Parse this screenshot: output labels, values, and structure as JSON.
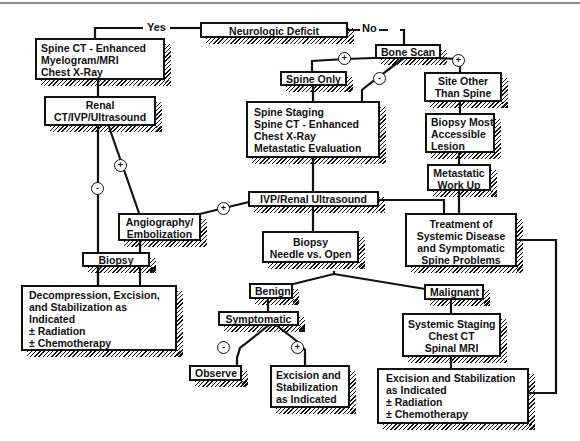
{
  "diagram": {
    "type": "flowchart",
    "nodes": {
      "neurologic_deficit": "Neurologic Deficit",
      "yes_label": "Yes",
      "no_label": "No",
      "spine_ct_block": [
        "Spine CT - Enhanced",
        "Myelogram/MRI",
        "Chest X-Ray"
      ],
      "renal_ct": [
        "Renal",
        "CT/IVP/Ultrasound"
      ],
      "angiography": [
        "Angiography/",
        "Embolization"
      ],
      "biopsy_left": "Biopsy",
      "decompression": [
        "Decompression, Excision,",
        "and Stabilization as",
        "Indicated",
        "± Radiation",
        "± Chemotherapy"
      ],
      "bone_scan": "Bone Scan",
      "spine_only": "Spine Only",
      "spine_staging": [
        "Spine Staging",
        "Spine CT - Enhanced",
        "Chest X-Ray",
        "Metastatic Evaluation"
      ],
      "site_other": [
        "Site Other",
        "Than Spine"
      ],
      "biopsy_most": [
        "Biopsy Most",
        "Accessible",
        "Lesion"
      ],
      "metastatic_workup": [
        "Metastatic",
        "Work Up"
      ],
      "ivp_renal": "IVP/Renal Ultrasound",
      "treatment_systemic": [
        "Treatment of",
        "Systemic Disease",
        "and Symptomatic",
        "Spine Problems"
      ],
      "biopsy_needle": [
        "Biopsy",
        "Needle vs. Open"
      ],
      "benign": "Benign",
      "malignant": "Malignant",
      "symptomatic": "Symptomatic",
      "observe": "Observe",
      "excision_benign": [
        "Excision and",
        "Stabilization",
        "as Indicated"
      ],
      "systemic_staging": [
        "Systemic Staging",
        "Chest CT",
        "Spinal MRI"
      ],
      "excision_malignant": [
        "Excision and Stabilization",
        "as Indicated",
        "± Radiation",
        "± Chemotherapy"
      ]
    },
    "signs": {
      "plus": "+",
      "minus": "-"
    },
    "edges": [
      {
        "from": "Neurologic Deficit",
        "to": "Spine CT - Enhanced",
        "label": "Yes"
      },
      {
        "from": "Neurologic Deficit",
        "to": "Bone Scan",
        "label": "No"
      },
      {
        "from": "Spine CT - Enhanced",
        "to": "Renal CT/IVP/Ultrasound"
      },
      {
        "from": "Renal CT/IVP/Ultrasound",
        "to": "Biopsy",
        "label": "-"
      },
      {
        "from": "Renal CT/IVP/Ultrasound",
        "to": "Angiography/Embolization",
        "label": "+"
      },
      {
        "from": "Angiography/Embolization",
        "to": "Biopsy"
      },
      {
        "from": "Biopsy",
        "to": "Decompression, Excision, and Stabilization"
      },
      {
        "from": "Bone Scan",
        "to": "Spine Only",
        "label": "+"
      },
      {
        "from": "Bone Scan",
        "to": "Spine Staging",
        "label": "-"
      },
      {
        "from": "Bone Scan",
        "to": "Site Other Than Spine",
        "label": "+"
      },
      {
        "from": "Spine Only",
        "to": "Spine Staging"
      },
      {
        "from": "Site Other Than Spine",
        "to": "Biopsy Most Accessible Lesion"
      },
      {
        "from": "Biopsy Most Accessible Lesion",
        "to": "Metastatic Work Up"
      },
      {
        "from": "Metastatic Work Up",
        "to": "Treatment of Systemic Disease"
      },
      {
        "from": "Spine Staging",
        "to": "IVP/Renal Ultrasound"
      },
      {
        "from": "IVP/Renal Ultrasound",
        "to": "Angiography/Embolization",
        "label": "+"
      },
      {
        "from": "IVP/Renal Ultrasound",
        "to": "Treatment of Systemic Disease"
      },
      {
        "from": "IVP/Renal Ultrasound",
        "to": "Biopsy Needle vs. Open"
      },
      {
        "from": "Biopsy Needle vs. Open",
        "to": "Benign"
      },
      {
        "from": "Biopsy Needle vs. Open",
        "to": "Malignant"
      },
      {
        "from": "Benign",
        "to": "Symptomatic"
      },
      {
        "from": "Symptomatic",
        "to": "Observe",
        "label": "-"
      },
      {
        "from": "Symptomatic",
        "to": "Excision and Stabilization as Indicated",
        "label": "+"
      },
      {
        "from": "Malignant",
        "to": "Systemic Staging"
      },
      {
        "from": "Systemic Staging",
        "to": "Excision and Stabilization (malignant)"
      },
      {
        "from": "Treatment of Systemic Disease",
        "to": "Excision and Stabilization (malignant)"
      }
    ]
  }
}
